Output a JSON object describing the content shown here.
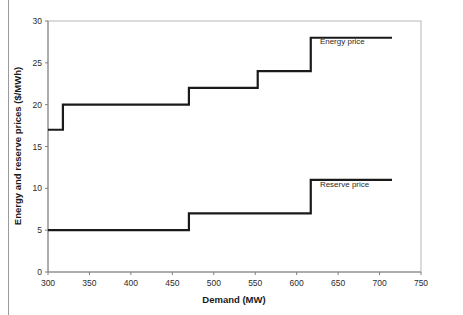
{
  "chart_data": {
    "type": "line",
    "title": "",
    "xlabel": "Demand (MW)",
    "ylabel": "Energy and reserve prices ($/MWh)",
    "xlim": [
      300,
      750
    ],
    "ylim": [
      0,
      30
    ],
    "xticks": [
      300,
      350,
      400,
      450,
      500,
      550,
      600,
      650,
      700,
      750
    ],
    "yticks": [
      0,
      5,
      10,
      15,
      20,
      25,
      30
    ],
    "grid": false,
    "legend_position": "inline-annotations",
    "series": [
      {
        "name": "Energy price",
        "style": "step-post",
        "annotation": "Energy price",
        "annotation_at": [
          628,
          27.2
        ],
        "x": [
          300,
          318,
          318,
          470,
          470,
          553,
          553,
          617,
          617,
          715
        ],
        "y": [
          17,
          17,
          20,
          20,
          22,
          22,
          24,
          24,
          28,
          28
        ],
        "steps": [
          {
            "from_x": 300,
            "to_x": 318,
            "value": 17
          },
          {
            "from_x": 318,
            "to_x": 470,
            "value": 20
          },
          {
            "from_x": 470,
            "to_x": 553,
            "value": 22
          },
          {
            "from_x": 553,
            "to_x": 617,
            "value": 24
          },
          {
            "from_x": 617,
            "to_x": 715,
            "value": 28
          }
        ]
      },
      {
        "name": "Reserve price",
        "style": "step-post",
        "annotation": "Reserve price",
        "annotation_at": [
          628,
          10.2
        ],
        "x": [
          300,
          470,
          470,
          617,
          617,
          715
        ],
        "y": [
          5,
          5,
          7,
          7,
          11,
          11
        ],
        "steps": [
          {
            "from_x": 300,
            "to_x": 470,
            "value": 5
          },
          {
            "from_x": 470,
            "to_x": 617,
            "value": 7
          },
          {
            "from_x": 617,
            "to_x": 715,
            "value": 11
          }
        ]
      }
    ]
  },
  "axes": {
    "x_label": "Demand (MW)",
    "y_label": "Energy and reserve prices ($/MWh)",
    "x_tick_labels": [
      "300",
      "350",
      "400",
      "450",
      "500",
      "550",
      "600",
      "650",
      "700",
      "750"
    ],
    "y_tick_labels": [
      "0",
      "5",
      "10",
      "15",
      "20",
      "25",
      "30"
    ]
  },
  "annotations": {
    "energy": "Energy price",
    "reserve": "Reserve price"
  },
  "colors": {
    "series_line": "#1a1a1a",
    "axis": "#808080",
    "frame": "#b5b5b5",
    "background": "#ffffff"
  }
}
